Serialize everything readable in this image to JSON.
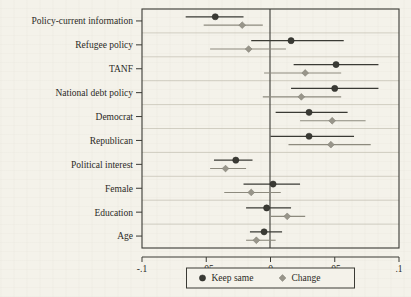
{
  "chart_data": {
    "type": "scatter",
    "title": "",
    "subtitle": "",
    "xlabel": "",
    "ylabel": "",
    "xlim": [
      -0.1,
      0.1
    ],
    "xticks": [
      -0.1,
      -0.05,
      0,
      0.05,
      0.1
    ],
    "xticklabels": [
      "-.1",
      "-.05",
      "0",
      ".05",
      ".1"
    ],
    "grid": "horizontal",
    "zero_reference_line": 0,
    "legend_position": "bottom-center",
    "legend": [
      {
        "name": "Keep same",
        "marker": "circle",
        "color": "#3a3a34"
      },
      {
        "name": "Change",
        "marker": "diamond",
        "color": "#98958a"
      }
    ],
    "categories": [
      "Policy-current information",
      "Refugee policy",
      "TANF",
      "National debt policy",
      "Democrat",
      "Republican",
      "Political interest",
      "Female",
      "Education",
      "Age"
    ],
    "series": [
      {
        "name": "Keep same",
        "marker": "circle",
        "color": "#3a3a34",
        "points": [
          {
            "category": "Policy-current information",
            "estimate": -0.043,
            "ci_low": -0.066,
            "ci_high": -0.021
          },
          {
            "category": "Refugee policy",
            "estimate": 0.016,
            "ci_low": -0.015,
            "ci_high": 0.057
          },
          {
            "category": "TANF",
            "estimate": 0.051,
            "ci_low": 0.018,
            "ci_high": 0.084
          },
          {
            "category": "National debt policy",
            "estimate": 0.05,
            "ci_low": 0.016,
            "ci_high": 0.084
          },
          {
            "category": "Democrat",
            "estimate": 0.03,
            "ci_low": 0.004,
            "ci_high": 0.06
          },
          {
            "category": "Republican",
            "estimate": 0.03,
            "ci_low": 0.0,
            "ci_high": 0.065
          },
          {
            "category": "Political interest",
            "estimate": -0.027,
            "ci_low": -0.044,
            "ci_high": -0.014
          },
          {
            "category": "Female",
            "estimate": 0.002,
            "ci_low": -0.021,
            "ci_high": 0.023
          },
          {
            "category": "Education",
            "estimate": -0.003,
            "ci_low": -0.019,
            "ci_high": 0.016
          },
          {
            "category": "Age",
            "estimate": -0.005,
            "ci_low": -0.016,
            "ci_high": 0.009
          }
        ]
      },
      {
        "name": "Change",
        "marker": "diamond",
        "color": "#98958a",
        "points": [
          {
            "category": "Policy-current information",
            "estimate": -0.022,
            "ci_low": -0.052,
            "ci_high": -0.006
          },
          {
            "category": "Refugee policy",
            "estimate": -0.017,
            "ci_low": -0.047,
            "ci_high": 0.012
          },
          {
            "category": "TANF",
            "estimate": 0.027,
            "ci_low": -0.005,
            "ci_high": 0.055
          },
          {
            "category": "National debt policy",
            "estimate": 0.024,
            "ci_low": -0.006,
            "ci_high": 0.055
          },
          {
            "category": "Democrat",
            "estimate": 0.048,
            "ci_low": 0.023,
            "ci_high": 0.074
          },
          {
            "category": "Republican",
            "estimate": 0.047,
            "ci_low": 0.014,
            "ci_high": 0.078
          },
          {
            "category": "Political interest",
            "estimate": -0.035,
            "ci_low": -0.047,
            "ci_high": -0.019
          },
          {
            "category": "Female",
            "estimate": -0.015,
            "ci_low": -0.036,
            "ci_high": 0.008
          },
          {
            "category": "Education",
            "estimate": 0.013,
            "ci_low": 0.0,
            "ci_high": 0.027
          },
          {
            "category": "Age",
            "estimate": -0.011,
            "ci_low": -0.019,
            "ci_high": 0.004
          }
        ]
      }
    ]
  }
}
